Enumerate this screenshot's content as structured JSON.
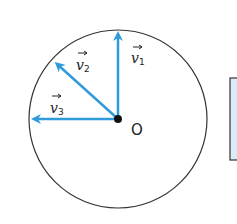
{
  "diagram": {
    "center_label": "O",
    "vectors": [
      {
        "name": "v",
        "subscript": "1",
        "direction": "up"
      },
      {
        "name": "v",
        "subscript": "2",
        "direction": "up-left"
      },
      {
        "name": "v",
        "subscript": "3",
        "direction": "left"
      }
    ],
    "colors": {
      "vector": "#2f9bd9",
      "circle": "#333333",
      "box_fill": "#dcecf6",
      "box_border": "#333333"
    }
  }
}
